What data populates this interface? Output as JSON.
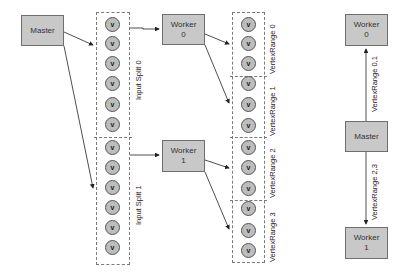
{
  "left_diagram": {
    "master": {
      "label": "Master"
    },
    "input_splits": [
      {
        "label": "Input Split 0",
        "vertex_count": 6
      },
      {
        "label": "Input Split 1",
        "vertex_count": 6
      }
    ],
    "workers": [
      {
        "line1": "Worker",
        "line2": "0"
      },
      {
        "line1": "Worker",
        "line2": "1"
      }
    ],
    "vertex_ranges": [
      {
        "label": "VertexRange 0"
      },
      {
        "label": "VertexRange 1"
      },
      {
        "label": "VertexRange 2"
      },
      {
        "label": "VertexRange 3"
      }
    ],
    "vertex_glyph": "v"
  },
  "right_diagram": {
    "worker_top": {
      "line1": "Worker",
      "line2": "0"
    },
    "master": {
      "label": "Master"
    },
    "worker_bottom": {
      "line1": "Worker",
      "line2": "1"
    },
    "edge_top_label": "VertexRange 0,1",
    "edge_bottom_label": "VertexRange 2,3"
  },
  "colors": {
    "box_fill": "#c8c8c8",
    "box_border": "#6e6e6e",
    "vertex_fill": "#bdbdbd",
    "line": "#222222"
  }
}
